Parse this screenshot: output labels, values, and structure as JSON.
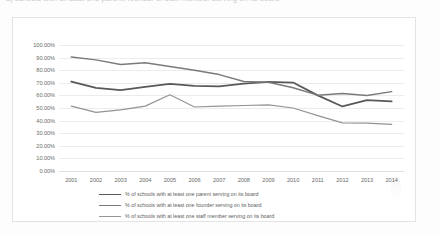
{
  "title_fragment": "a) schools with at least one parent, founder or staff member serving on its board",
  "chart_data": {
    "type": "line",
    "title": "",
    "xlabel": "",
    "ylabel": "",
    "ylim": [
      0,
      100
    ],
    "ytick_labels": [
      "100.00%",
      "90.00%",
      "80.00%",
      "70.00%",
      "60.00%",
      "50.00%",
      "40.00%",
      "30.00%",
      "20.00%",
      "10.00%",
      "0.00%"
    ],
    "ytick_values": [
      100,
      90,
      80,
      70,
      60,
      50,
      40,
      30,
      20,
      10,
      0
    ],
    "categories": [
      "2001",
      "2002",
      "2003",
      "2004",
      "2005",
      "2006",
      "2007",
      "2008",
      "2009",
      "2010",
      "2011",
      "2012",
      "2013",
      "2014"
    ],
    "grid": true,
    "legend_position": "bottom",
    "series": [
      {
        "name": "% of schools with at least one parent serving on its board",
        "color": "#595959",
        "width": 1.8,
        "values": [
          71.0,
          66.0,
          64.2,
          66.8,
          69.2,
          67.5,
          67.2,
          69.3,
          70.8,
          70.2,
          60.0,
          51.2,
          56.2,
          55.3
        ]
      },
      {
        "name": "% of schools with at least one founder serving on its board",
        "color": "#7a7a7a",
        "width": 1.5,
        "values": [
          90.5,
          88.2,
          84.5,
          86.0,
          83.0,
          80.0,
          76.5,
          71.0,
          70.5,
          66.0,
          60.2,
          61.5,
          60.0,
          63.0
        ]
      },
      {
        "name": "% of schools with at least one staff member serving on its board",
        "color": "#949494",
        "width": 1.2,
        "values": [
          51.5,
          46.5,
          48.5,
          51.5,
          60.5,
          50.8,
          51.5,
          52.0,
          52.5,
          50.0,
          44.0,
          38.2,
          38.0,
          37.0
        ]
      }
    ]
  }
}
